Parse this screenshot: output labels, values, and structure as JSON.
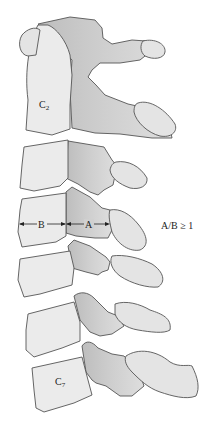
{
  "diagram": {
    "vertebra_labels": {
      "c2": {
        "main": "C",
        "sub": "2"
      },
      "c7": {
        "main": "C",
        "sub": "7"
      }
    },
    "measurements": {
      "a_label": "A",
      "b_label": "B",
      "ratio_label": "A/B ≥ 1"
    },
    "colors": {
      "body_fill": "#ebebeb",
      "arch_fill_light": "#d8d8d8",
      "arch_fill_dark": "#b5b5b5",
      "outline": "#555555"
    }
  }
}
